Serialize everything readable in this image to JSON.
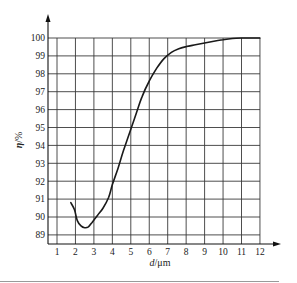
{
  "chart_data": {
    "type": "line",
    "title": "",
    "xlabel": "d/μm",
    "ylabel": "η/%",
    "x_ticks": [
      "1",
      "2",
      "3",
      "4",
      "5",
      "6",
      "7",
      "8",
      "9",
      "10",
      "11",
      "12"
    ],
    "y_ticks": [
      "89",
      "90",
      "91",
      "92",
      "93",
      "94",
      "95",
      "96",
      "97",
      "98",
      "99",
      "100"
    ],
    "xlim": [
      0.5,
      12
    ],
    "ylim": [
      88.5,
      100
    ],
    "grid": true,
    "legend": null,
    "series": [
      {
        "name": "η",
        "x": [
          1.75,
          1.95,
          2.1,
          2.3,
          2.5,
          2.7,
          2.9,
          3.2,
          3.5,
          3.8,
          4.0,
          4.3,
          4.6,
          5.0,
          5.3,
          5.6,
          6.0,
          6.4,
          6.8,
          7.2,
          7.6,
          8.0,
          8.5,
          9.0,
          9.5,
          10.0,
          10.5,
          11.0,
          11.5,
          12.0
        ],
        "y": [
          90.8,
          90.4,
          89.8,
          89.5,
          89.4,
          89.45,
          89.7,
          90.1,
          90.5,
          91.1,
          91.8,
          92.7,
          93.7,
          94.9,
          95.8,
          96.7,
          97.6,
          98.3,
          98.85,
          99.2,
          99.4,
          99.52,
          99.62,
          99.72,
          99.82,
          99.9,
          99.97,
          100.0,
          100.0,
          100.0
        ]
      }
    ]
  },
  "axes": {
    "x_label_italic": "d",
    "x_label_unit": "/μm",
    "y_label_italic": "η",
    "y_label_unit": "/%"
  },
  "colors": {
    "grid": "#3a3a3a",
    "curve": "#1a1a1a",
    "text": "#222222"
  }
}
